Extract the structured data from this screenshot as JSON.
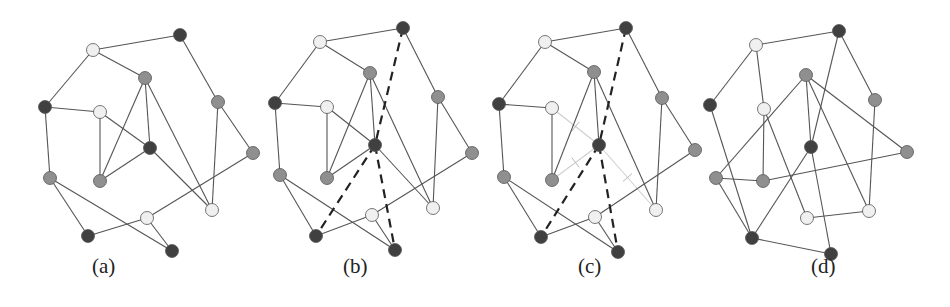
{
  "figure": {
    "node_colors": {
      "dark": "#404040",
      "gray": "#8f8f8f",
      "light": "#f0f0f0"
    },
    "panels": [
      {
        "label": "(a)",
        "label_x": 92,
        "nodes": [
          {
            "id": "n1",
            "x": 93,
            "y": 50,
            "shade": "light"
          },
          {
            "id": "n2",
            "x": 180,
            "y": 35,
            "shade": "dark"
          },
          {
            "id": "n3",
            "x": 145,
            "y": 78,
            "shade": "gray"
          },
          {
            "id": "n4",
            "x": 45,
            "y": 107,
            "shade": "dark"
          },
          {
            "id": "n5",
            "x": 100,
            "y": 112,
            "shade": "light"
          },
          {
            "id": "n6",
            "x": 150,
            "y": 148,
            "shade": "dark"
          },
          {
            "id": "n7",
            "x": 218,
            "y": 102,
            "shade": "gray"
          },
          {
            "id": "n8",
            "x": 253,
            "y": 153,
            "shade": "gray"
          },
          {
            "id": "n9",
            "x": 50,
            "y": 178,
            "shade": "gray"
          },
          {
            "id": "n10",
            "x": 100,
            "y": 181,
            "shade": "gray"
          },
          {
            "id": "n11",
            "x": 212,
            "y": 210,
            "shade": "light"
          },
          {
            "id": "n12",
            "x": 147,
            "y": 218,
            "shade": "light"
          },
          {
            "id": "n13",
            "x": 88,
            "y": 236,
            "shade": "dark"
          },
          {
            "id": "n14",
            "x": 172,
            "y": 251,
            "shade": "dark"
          }
        ],
        "edges": [
          [
            "n1",
            "n2",
            "solid"
          ],
          [
            "n1",
            "n3",
            "solid"
          ],
          [
            "n1",
            "n4",
            "solid"
          ],
          [
            "n2",
            "n7",
            "solid"
          ],
          [
            "n3",
            "n10",
            "solid"
          ],
          [
            "n3",
            "n6",
            "solid"
          ],
          [
            "n3",
            "n11",
            "solid"
          ],
          [
            "n4",
            "n5",
            "solid"
          ],
          [
            "n4",
            "n9",
            "solid"
          ],
          [
            "n5",
            "n10",
            "solid"
          ],
          [
            "n5",
            "n6",
            "solid"
          ],
          [
            "n6",
            "n10",
            "solid"
          ],
          [
            "n6",
            "n11",
            "solid"
          ],
          [
            "n7",
            "n8",
            "solid"
          ],
          [
            "n7",
            "n11",
            "solid"
          ],
          [
            "n8",
            "n12",
            "solid"
          ],
          [
            "n9",
            "n13",
            "solid"
          ],
          [
            "n9",
            "n14",
            "solid"
          ],
          [
            "n12",
            "n13",
            "solid"
          ],
          [
            "n12",
            "n14",
            "solid"
          ]
        ]
      },
      {
        "label": "(b)",
        "label_x": 343,
        "nodes": [
          {
            "id": "n1",
            "x": 320,
            "y": 42,
            "shade": "light"
          },
          {
            "id": "n2",
            "x": 403,
            "y": 28,
            "shade": "dark"
          },
          {
            "id": "n3",
            "x": 370,
            "y": 73,
            "shade": "gray"
          },
          {
            "id": "n4",
            "x": 275,
            "y": 103,
            "shade": "dark"
          },
          {
            "id": "n5",
            "x": 327,
            "y": 107,
            "shade": "light"
          },
          {
            "id": "n6",
            "x": 375,
            "y": 145,
            "shade": "dark"
          },
          {
            "id": "n7",
            "x": 438,
            "y": 97,
            "shade": "gray"
          },
          {
            "id": "n8",
            "x": 472,
            "y": 153,
            "shade": "gray"
          },
          {
            "id": "n9",
            "x": 280,
            "y": 175,
            "shade": "gray"
          },
          {
            "id": "n10",
            "x": 327,
            "y": 178,
            "shade": "gray"
          },
          {
            "id": "n11",
            "x": 433,
            "y": 208,
            "shade": "light"
          },
          {
            "id": "n12",
            "x": 372,
            "y": 215,
            "shade": "light"
          },
          {
            "id": "n13",
            "x": 316,
            "y": 236,
            "shade": "dark"
          },
          {
            "id": "n14",
            "x": 395,
            "y": 250,
            "shade": "dark"
          }
        ],
        "edges": [
          [
            "n1",
            "n2",
            "solid"
          ],
          [
            "n1",
            "n3",
            "solid"
          ],
          [
            "n1",
            "n4",
            "solid"
          ],
          [
            "n2",
            "n7",
            "solid"
          ],
          [
            "n3",
            "n10",
            "solid"
          ],
          [
            "n3",
            "n6",
            "solid"
          ],
          [
            "n3",
            "n11",
            "solid"
          ],
          [
            "n4",
            "n5",
            "solid"
          ],
          [
            "n4",
            "n9",
            "solid"
          ],
          [
            "n5",
            "n10",
            "solid"
          ],
          [
            "n5",
            "n6",
            "solid"
          ],
          [
            "n6",
            "n10",
            "solid"
          ],
          [
            "n6",
            "n11",
            "solid"
          ],
          [
            "n7",
            "n8",
            "solid"
          ],
          [
            "n7",
            "n11",
            "solid"
          ],
          [
            "n8",
            "n12",
            "solid"
          ],
          [
            "n9",
            "n13",
            "solid"
          ],
          [
            "n9",
            "n14",
            "solid"
          ],
          [
            "n12",
            "n13",
            "solid"
          ],
          [
            "n12",
            "n14",
            "solid"
          ],
          [
            "n2",
            "n6",
            "dashed"
          ],
          [
            "n6",
            "n13",
            "dashed"
          ],
          [
            "n6",
            "n14",
            "dashed"
          ]
        ]
      },
      {
        "label": "(c)",
        "label_x": 578,
        "nodes": [
          {
            "id": "n1",
            "x": 545,
            "y": 42,
            "shade": "light"
          },
          {
            "id": "n2",
            "x": 626,
            "y": 28,
            "shade": "dark"
          },
          {
            "id": "n3",
            "x": 594,
            "y": 72,
            "shade": "gray"
          },
          {
            "id": "n4",
            "x": 499,
            "y": 104,
            "shade": "dark"
          },
          {
            "id": "n5",
            "x": 552,
            "y": 108,
            "shade": "light"
          },
          {
            "id": "n6",
            "x": 599,
            "y": 145,
            "shade": "dark"
          },
          {
            "id": "n7",
            "x": 662,
            "y": 98,
            "shade": "gray"
          },
          {
            "id": "n8",
            "x": 695,
            "y": 150,
            "shade": "gray"
          },
          {
            "id": "n9",
            "x": 504,
            "y": 177,
            "shade": "gray"
          },
          {
            "id": "n10",
            "x": 552,
            "y": 180,
            "shade": "gray"
          },
          {
            "id": "n11",
            "x": 656,
            "y": 210,
            "shade": "light"
          },
          {
            "id": "n12",
            "x": 595,
            "y": 217,
            "shade": "light"
          },
          {
            "id": "n13",
            "x": 541,
            "y": 237,
            "shade": "dark"
          },
          {
            "id": "n14",
            "x": 618,
            "y": 252,
            "shade": "dark"
          }
        ],
        "edges": [
          [
            "n1",
            "n2",
            "solid"
          ],
          [
            "n1",
            "n3",
            "solid"
          ],
          [
            "n1",
            "n4",
            "solid"
          ],
          [
            "n2",
            "n7",
            "solid"
          ],
          [
            "n3",
            "n10",
            "solid"
          ],
          [
            "n3",
            "n6",
            "solid"
          ],
          [
            "n3",
            "n11",
            "solid"
          ],
          [
            "n4",
            "n5",
            "solid"
          ],
          [
            "n4",
            "n9",
            "solid"
          ],
          [
            "n5",
            "n10",
            "solid"
          ],
          [
            "n5",
            "n6",
            "removed"
          ],
          [
            "n6",
            "n10",
            "removed"
          ],
          [
            "n6",
            "n11",
            "removed"
          ],
          [
            "n7",
            "n8",
            "solid"
          ],
          [
            "n7",
            "n11",
            "solid"
          ],
          [
            "n8",
            "n12",
            "solid"
          ],
          [
            "n9",
            "n13",
            "solid"
          ],
          [
            "n9",
            "n14",
            "solid"
          ],
          [
            "n12",
            "n13",
            "solid"
          ],
          [
            "n12",
            "n14",
            "solid"
          ],
          [
            "n2",
            "n6",
            "dashed"
          ],
          [
            "n6",
            "n13",
            "dashed"
          ],
          [
            "n6",
            "n14",
            "dashed"
          ]
        ]
      },
      {
        "label": "(d)",
        "label_x": 811,
        "nodes": [
          {
            "id": "a",
            "x": 756,
            "y": 45,
            "shade": "light"
          },
          {
            "id": "b",
            "x": 839,
            "y": 31,
            "shade": "dark"
          },
          {
            "id": "c",
            "x": 806,
            "y": 75,
            "shade": "gray"
          },
          {
            "id": "d",
            "x": 710,
            "y": 105,
            "shade": "dark"
          },
          {
            "id": "e",
            "x": 764,
            "y": 109,
            "shade": "light"
          },
          {
            "id": "f",
            "x": 811,
            "y": 147,
            "shade": "dark"
          },
          {
            "id": "g",
            "x": 875,
            "y": 100,
            "shade": "gray"
          },
          {
            "id": "h",
            "x": 907,
            "y": 152,
            "shade": "gray"
          },
          {
            "id": "i",
            "x": 716,
            "y": 178,
            "shade": "gray"
          },
          {
            "id": "j",
            "x": 763,
            "y": 181,
            "shade": "gray"
          },
          {
            "id": "k",
            "x": 869,
            "y": 211,
            "shade": "light"
          },
          {
            "id": "l",
            "x": 807,
            "y": 218,
            "shade": "light"
          },
          {
            "id": "m",
            "x": 752,
            "y": 238,
            "shade": "dark"
          },
          {
            "id": "n",
            "x": 831,
            "y": 254,
            "shade": "dark"
          }
        ],
        "edges": [
          [
            "a",
            "b",
            "solid"
          ],
          [
            "a",
            "d",
            "solid"
          ],
          [
            "a",
            "e",
            "solid"
          ],
          [
            "b",
            "g",
            "solid"
          ],
          [
            "b",
            "f",
            "solid"
          ],
          [
            "c",
            "i",
            "solid"
          ],
          [
            "c",
            "f",
            "solid"
          ],
          [
            "c",
            "k",
            "solid"
          ],
          [
            "c",
            "h",
            "solid"
          ],
          [
            "d",
            "m",
            "solid"
          ],
          [
            "e",
            "j",
            "solid"
          ],
          [
            "e",
            "l",
            "solid"
          ],
          [
            "f",
            "m",
            "solid"
          ],
          [
            "f",
            "n",
            "solid"
          ],
          [
            "g",
            "k",
            "solid"
          ],
          [
            "h",
            "j",
            "solid"
          ],
          [
            "i",
            "j",
            "solid"
          ],
          [
            "i",
            "m",
            "solid"
          ],
          [
            "l",
            "k",
            "solid"
          ],
          [
            "m",
            "n",
            "solid"
          ]
        ]
      }
    ]
  }
}
